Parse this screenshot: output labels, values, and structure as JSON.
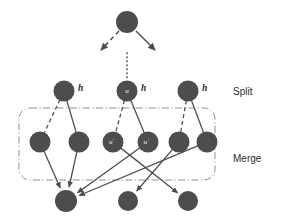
{
  "diagram": {
    "colors": {
      "node_fill": "#4d4d4d",
      "edge": "#4d4d4d",
      "group_box": "#8f8f8f",
      "label_text": "#2b2b2b",
      "node_label_text": "#ffffff",
      "background": "#ffffff"
    },
    "regions": [
      {
        "id": "split",
        "label": "Split",
        "x": 233,
        "y": 92
      },
      {
        "id": "merge",
        "label": "Merge",
        "x": 233,
        "y": 159
      }
    ],
    "group_box": {
      "x": 19,
      "y": 108,
      "width": 196,
      "height": 72,
      "radius": 11
    },
    "dotted_separator": {
      "x": 127,
      "y1": 53,
      "y2": 78
    },
    "nodes": [
      {
        "id": "root",
        "cx": 127,
        "cy": 22,
        "r": 11,
        "inner_label": "",
        "inner_sup": "",
        "outer_label": ""
      },
      {
        "id": "s1",
        "cx": 64,
        "cy": 91,
        "r": 10.5,
        "inner_label": "",
        "inner_sup": "",
        "outer_label": "h"
      },
      {
        "id": "s2",
        "cx": 127,
        "cy": 91,
        "r": 10.5,
        "inner_label": "u",
        "inner_sup": "",
        "outer_label": "h"
      },
      {
        "id": "s3",
        "cx": 188,
        "cy": 91,
        "r": 10.5,
        "inner_label": "",
        "inner_sup": "",
        "outer_label": "h"
      },
      {
        "id": "m1",
        "cx": 40,
        "cy": 142,
        "r": 10.5,
        "inner_label": "",
        "inner_sup": "",
        "outer_label": ""
      },
      {
        "id": "m2",
        "cx": 79,
        "cy": 142,
        "r": 10.5,
        "inner_label": "",
        "inner_sup": "",
        "outer_label": ""
      },
      {
        "id": "m3",
        "cx": 113,
        "cy": 142,
        "r": 10.5,
        "inner_label": "u",
        "inner_sup": "-",
        "outer_label": ""
      },
      {
        "id": "m4",
        "cx": 148,
        "cy": 142,
        "r": 10.5,
        "inner_label": "u",
        "inner_sup": "+",
        "outer_label": ""
      },
      {
        "id": "m5",
        "cx": 179,
        "cy": 142,
        "r": 10.5,
        "inner_label": "",
        "inner_sup": "",
        "outer_label": ""
      },
      {
        "id": "m6",
        "cx": 207,
        "cy": 142,
        "r": 10.5,
        "inner_label": "",
        "inner_sup": "",
        "outer_label": ""
      },
      {
        "id": "b1",
        "cx": 66,
        "cy": 201,
        "r": 11,
        "inner_label": "",
        "inner_sup": "",
        "outer_label": ""
      },
      {
        "id": "b2",
        "cx": 128,
        "cy": 201,
        "r": 10,
        "inner_label": "",
        "inner_sup": "",
        "outer_label": ""
      },
      {
        "id": "b3",
        "cx": 188,
        "cy": 201,
        "r": 10,
        "inner_label": "",
        "inner_sup": "",
        "outer_label": ""
      }
    ],
    "root_arrows": [
      {
        "id": "root-arrow-left",
        "style": "dashed",
        "x1": 119,
        "y1": 31,
        "x2": 101,
        "y2": 50
      },
      {
        "id": "root-arrow-right",
        "style": "solid",
        "x1": 136,
        "y1": 31,
        "x2": 155,
        "y2": 50
      }
    ],
    "split_edges": [
      {
        "id": "s1-m1",
        "style": "dashed",
        "from": "s1",
        "to": "m1"
      },
      {
        "id": "s1-m2",
        "style": "solid",
        "from": "s1",
        "to": "m2"
      },
      {
        "id": "s2-m3",
        "style": "dashed",
        "from": "s2",
        "to": "m3"
      },
      {
        "id": "s2-m4",
        "style": "solid",
        "from": "s2",
        "to": "m4"
      },
      {
        "id": "s3-m5",
        "style": "dashed",
        "from": "s3",
        "to": "m5"
      },
      {
        "id": "s3-m6",
        "style": "solid",
        "from": "s3",
        "to": "m6"
      }
    ],
    "merge_edges": [
      {
        "id": "m1-b1",
        "style": "solid",
        "from": "m1",
        "to": "b1"
      },
      {
        "id": "m2-b1",
        "style": "solid",
        "from": "m2",
        "to": "b1"
      },
      {
        "id": "m3-b3",
        "style": "solid",
        "from": "m3",
        "to": "b3"
      },
      {
        "id": "m4-b1",
        "style": "solid",
        "from": "m4",
        "to": "b1"
      },
      {
        "id": "m5-b2",
        "style": "solid",
        "from": "m5",
        "to": "b2"
      },
      {
        "id": "m6-b1",
        "style": "solid",
        "from": "m6",
        "to": "b1"
      }
    ]
  }
}
